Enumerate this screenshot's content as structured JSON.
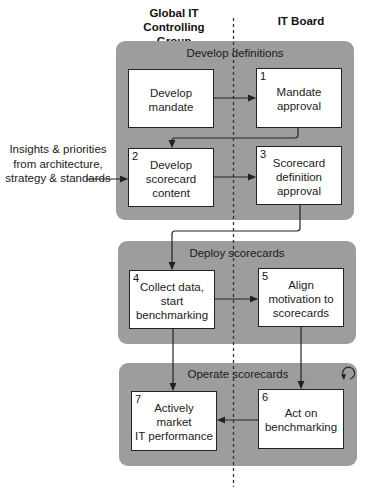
{
  "lanes": {
    "left": "Global IT Controlling\nGroup",
    "right": "IT Board"
  },
  "external_input": "Insights & priorities\nfrom architecture,\nstrategy & standards",
  "phases": [
    {
      "title": "Develop definitions",
      "boxes": [
        {
          "number": "",
          "label": "Develop\nmandate"
        },
        {
          "number": "1",
          "label": "Mandate\napproval"
        },
        {
          "number": "2",
          "label": "Develop\nscorecard\ncontent"
        },
        {
          "number": "3",
          "label": "Scorecard\ndefinition\napproval"
        }
      ]
    },
    {
      "title": "Deploy scorecards",
      "boxes": [
        {
          "number": "4",
          "label": "Collect data,\nstart\nbenchmarking"
        },
        {
          "number": "5",
          "label": "Align\nmotivation to\nscorecards"
        }
      ]
    },
    {
      "title": "Operate scorecards",
      "icon": "cycle-icon",
      "boxes": [
        {
          "number": "7",
          "label": "Actively\nmarket\nIT performance"
        },
        {
          "number": "6",
          "label": "Act on\nbenchmarking"
        }
      ]
    }
  ],
  "colors": {
    "panel": "#9d9d9d",
    "box": "#ffffff",
    "line": "#222222"
  }
}
